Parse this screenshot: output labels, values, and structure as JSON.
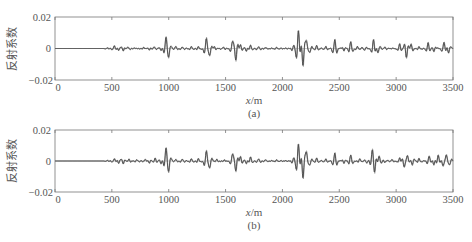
{
  "chart_data": [
    {
      "type": "line",
      "panel": "(a)",
      "caption": "(a)",
      "xlabel": "x/m",
      "xlabel_italic_part": "x",
      "xlabel_unit": "/m",
      "ylabel": "反射系数",
      "xlim": [
        0,
        3500
      ],
      "ylim": [
        -0.02,
        0.02
      ],
      "xticks": [
        0,
        500,
        1000,
        1500,
        2000,
        2500,
        3000,
        3500
      ],
      "xtick_labels": [
        "0",
        "500",
        "1000",
        "1500",
        "2000",
        "2500",
        "3000",
        "3500"
      ],
      "yticks": [
        -0.02,
        0,
        0.02
      ],
      "ytick_labels": [
        "−0.02",
        "0",
        "0.02"
      ],
      "grid": false,
      "legend": null,
      "series": [
        {
          "name": "reflectivity-1",
          "color": "#555555",
          "events": [
            {
              "x": 460,
              "a": 0.0005
            },
            {
              "x": 520,
              "a": 0.0015
            },
            {
              "x": 560,
              "a": -0.0012
            },
            {
              "x": 600,
              "a": -0.0015
            },
            {
              "x": 640,
              "a": 0.0008
            },
            {
              "x": 700,
              "a": 0.0005
            },
            {
              "x": 780,
              "a": 0.0008
            },
            {
              "x": 830,
              "a": -0.0008
            },
            {
              "x": 870,
              "a": 0.001
            },
            {
              "x": 930,
              "a": -0.001
            },
            {
              "x": 975,
              "a": 0.0065
            },
            {
              "x": 1000,
              "a": -0.004
            },
            {
              "x": 1060,
              "a": 0.0015
            },
            {
              "x": 1120,
              "a": 0.0008
            },
            {
              "x": 1200,
              "a": 0.001
            },
            {
              "x": 1260,
              "a": 0.0012
            },
            {
              "x": 1330,
              "a": 0.0065
            },
            {
              "x": 1360,
              "a": -0.004
            },
            {
              "x": 1400,
              "a": 0.001
            },
            {
              "x": 1480,
              "a": 0.0008
            },
            {
              "x": 1560,
              "a": 0.004
            },
            {
              "x": 1590,
              "a": -0.0075
            },
            {
              "x": 1630,
              "a": 0.002
            },
            {
              "x": 1680,
              "a": -0.0015
            },
            {
              "x": 1720,
              "a": 0.002
            },
            {
              "x": 1790,
              "a": 0.001
            },
            {
              "x": 1850,
              "a": 0.0008
            },
            {
              "x": 1950,
              "a": 0.0005
            },
            {
              "x": 2100,
              "a": 0.002
            },
            {
              "x": 2140,
              "a": 0.011
            },
            {
              "x": 2180,
              "a": -0.0105
            },
            {
              "x": 2210,
              "a": 0.004
            },
            {
              "x": 2240,
              "a": -0.002
            },
            {
              "x": 2300,
              "a": 0.0015
            },
            {
              "x": 2380,
              "a": 0.001
            },
            {
              "x": 2460,
              "a": 0.0055
            },
            {
              "x": 2540,
              "a": -0.0015
            },
            {
              "x": 2600,
              "a": 0.0045
            },
            {
              "x": 2660,
              "a": 0.001
            },
            {
              "x": 2720,
              "a": -0.001
            },
            {
              "x": 2800,
              "a": 0.0055
            },
            {
              "x": 2840,
              "a": -0.0025
            },
            {
              "x": 2900,
              "a": 0.0008
            },
            {
              "x": 3030,
              "a": 0.003
            },
            {
              "x": 3090,
              "a": -0.006
            },
            {
              "x": 3130,
              "a": 0.0025
            },
            {
              "x": 3200,
              "a": 0.001
            },
            {
              "x": 3280,
              "a": 0.0035
            },
            {
              "x": 3330,
              "a": -0.002
            },
            {
              "x": 3420,
              "a": 0.004
            },
            {
              "x": 3460,
              "a": -0.0025
            }
          ]
        },
        {
          "name": "reflectivity-2",
          "color": "#999999",
          "note": "second overlaid curve, nearly coincident, slightly larger amplitude at major events"
        }
      ]
    },
    {
      "type": "line",
      "panel": "(b)",
      "caption": "(b)",
      "xlabel": "x/m",
      "xlabel_italic_part": "x",
      "xlabel_unit": "/m",
      "ylabel": "反射系数",
      "xlim": [
        0,
        3500
      ],
      "ylim": [
        -0.02,
        0.02
      ],
      "xticks": [
        0,
        500,
        1000,
        1500,
        2000,
        2500,
        3000,
        3500
      ],
      "xtick_labels": [
        "0",
        "500",
        "1000",
        "1500",
        "2000",
        "2500",
        "3000",
        "3500"
      ],
      "yticks": [
        -0.02,
        0,
        0.02
      ],
      "ytick_labels": [
        "−0.02",
        "0",
        "0.02"
      ],
      "grid": false,
      "legend": null,
      "series": [
        {
          "name": "reflectivity-1",
          "color": "#555555",
          "events": [
            {
              "x": 460,
              "a": 0.0005
            },
            {
              "x": 520,
              "a": 0.0012
            },
            {
              "x": 560,
              "a": -0.0015
            },
            {
              "x": 600,
              "a": -0.0018
            },
            {
              "x": 650,
              "a": 0.001
            },
            {
              "x": 720,
              "a": 0.0006
            },
            {
              "x": 790,
              "a": 0.001
            },
            {
              "x": 830,
              "a": -0.0012
            },
            {
              "x": 880,
              "a": 0.0015
            },
            {
              "x": 930,
              "a": -0.0015
            },
            {
              "x": 975,
              "a": 0.0075
            },
            {
              "x": 1000,
              "a": -0.005
            },
            {
              "x": 1060,
              "a": 0.0012
            },
            {
              "x": 1120,
              "a": 0.001
            },
            {
              "x": 1200,
              "a": 0.0012
            },
            {
              "x": 1260,
              "a": 0.0015
            },
            {
              "x": 1330,
              "a": 0.0065
            },
            {
              "x": 1360,
              "a": -0.004
            },
            {
              "x": 1420,
              "a": 0.001
            },
            {
              "x": 1490,
              "a": 0.0008
            },
            {
              "x": 1560,
              "a": 0.004
            },
            {
              "x": 1590,
              "a": -0.0065
            },
            {
              "x": 1630,
              "a": 0.0025
            },
            {
              "x": 1680,
              "a": -0.0015
            },
            {
              "x": 1720,
              "a": 0.0025
            },
            {
              "x": 1790,
              "a": 0.0012
            },
            {
              "x": 1850,
              "a": 0.001
            },
            {
              "x": 1950,
              "a": 0.0005
            },
            {
              "x": 2100,
              "a": 0.002
            },
            {
              "x": 2140,
              "a": 0.0105
            },
            {
              "x": 2180,
              "a": -0.0105
            },
            {
              "x": 2210,
              "a": 0.005
            },
            {
              "x": 2240,
              "a": -0.002
            },
            {
              "x": 2300,
              "a": 0.0015
            },
            {
              "x": 2380,
              "a": 0.001
            },
            {
              "x": 2460,
              "a": 0.005
            },
            {
              "x": 2540,
              "a": -0.0015
            },
            {
              "x": 2600,
              "a": 0.004
            },
            {
              "x": 2680,
              "a": 0.0015
            },
            {
              "x": 2740,
              "a": -0.0015
            },
            {
              "x": 2790,
              "a": 0.0055
            },
            {
              "x": 2810,
              "a": -0.005
            },
            {
              "x": 2850,
              "a": 0.003
            },
            {
              "x": 2900,
              "a": -0.001
            },
            {
              "x": 2960,
              "a": 0.001
            },
            {
              "x": 3030,
              "a": 0.002
            },
            {
              "x": 3070,
              "a": -0.0035
            },
            {
              "x": 3100,
              "a": 0.003
            },
            {
              "x": 3140,
              "a": -0.0025
            },
            {
              "x": 3200,
              "a": 0.0015
            },
            {
              "x": 3290,
              "a": 0.003
            },
            {
              "x": 3330,
              "a": -0.0025
            },
            {
              "x": 3370,
              "a": 0.0035
            },
            {
              "x": 3410,
              "a": -0.003
            },
            {
              "x": 3440,
              "a": 0.0035
            },
            {
              "x": 3470,
              "a": -0.002
            }
          ]
        },
        {
          "name": "reflectivity-2",
          "color": "#999999",
          "note": "second overlaid curve, nearly coincident"
        }
      ]
    }
  ],
  "labels": {
    "ylabel": "反射系数",
    "xlabel_var": "x",
    "xlabel_unit": "/m",
    "caption_a": "(a)",
    "caption_b": "(b)",
    "ytick_top": "0.02",
    "ytick_mid": "0",
    "ytick_bot": "−0.02",
    "xticks": [
      "0",
      "500",
      "1000",
      "1500",
      "2000",
      "2500",
      "3000",
      "3500"
    ]
  }
}
